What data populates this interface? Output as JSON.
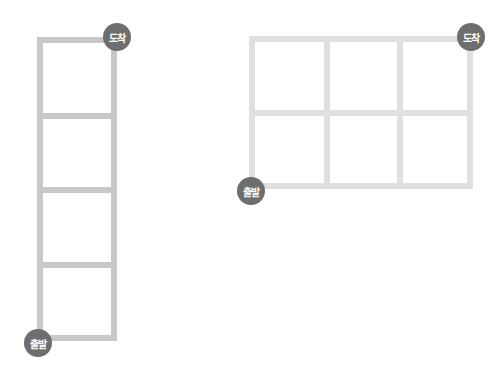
{
  "diagrams": [
    {
      "id": "left",
      "rows": 4,
      "cols": 1,
      "line_color": "#c8c8c8",
      "start_label": "출발",
      "end_label": "도착"
    },
    {
      "id": "right",
      "rows": 2,
      "cols": 3,
      "line_color": "#e0e0e0",
      "start_label": "출발",
      "end_label": "도착"
    }
  ],
  "colors": {
    "badge": "#6e6e6e",
    "badge_text": "#ffffff"
  }
}
